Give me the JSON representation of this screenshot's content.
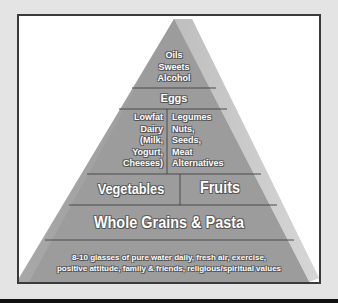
{
  "diagram": {
    "type": "food-pyramid",
    "tiers": [
      {
        "id": "top",
        "lines": [
          "Oils",
          "Sweets",
          "Alcohol"
        ]
      },
      {
        "id": "eggs",
        "label": "Eggs"
      },
      {
        "id": "dairy-protein",
        "left": {
          "lines": [
            "Lowfat",
            "Dairy",
            "(Milk,",
            "Yogurt,",
            "Cheeses)"
          ]
        },
        "right": {
          "lines": [
            "Legumes",
            "Nuts,",
            "Seeds,",
            "Meat",
            "Alternatives"
          ]
        }
      },
      {
        "id": "veg-fruit",
        "left": {
          "label": "Vegetables"
        },
        "right": {
          "label": "Fruits"
        }
      },
      {
        "id": "grains",
        "label": "Whole Grains & Pasta"
      },
      {
        "id": "base",
        "lines": [
          "8-10 glasses of pure water daily, fresh air, exercise,",
          "positive attitude, family & friends, religious/spiritual values"
        ]
      }
    ],
    "colors": {
      "front_face": "#9a9a9a",
      "side_face": "#c4c4c4",
      "divider": "#4a4a4a",
      "frame_border": "#3a3a3a",
      "background": "#e4e4e4"
    }
  }
}
